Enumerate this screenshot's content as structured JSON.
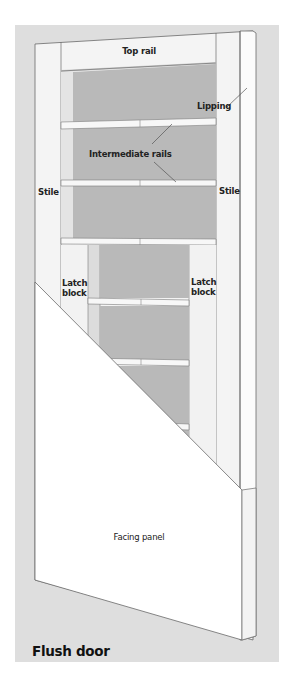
{
  "diagram": {
    "title": "Flush door",
    "colors": {
      "background_panel": "#dedede",
      "frame_wood": "#f4f4f4",
      "core_gray": "#b9b9b9",
      "facing_panel": "#ffffff",
      "outline": "#6a6a6a"
    },
    "labels": {
      "top_rail": "Top rail",
      "lipping": "Lipping",
      "intermediate_rails": "Intermediate rails",
      "stile_left": "Stile",
      "stile_right": "Stile",
      "latch_block_left_1": "Latch",
      "latch_block_left_2": "block",
      "latch_block_right_1": "Latch",
      "latch_block_right_2": "block",
      "facing_panel": "Facing panel"
    }
  }
}
